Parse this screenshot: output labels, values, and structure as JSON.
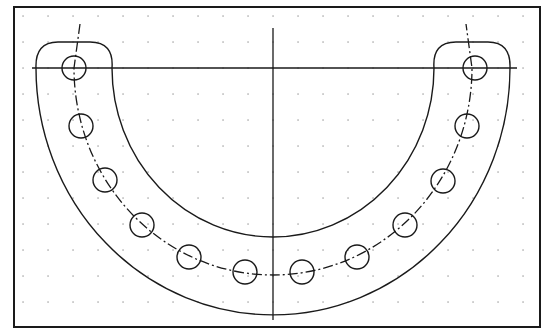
{
  "drawing": {
    "type": "cad-part-outline",
    "description": "Horseshoe (U-shaped) flange with bolt-hole pattern on a dotted grid",
    "colors": {
      "background": "#ffffff",
      "line": "#1a1a1a",
      "grid": "#9a9a9a"
    },
    "frame": {
      "x": 14,
      "y": 7,
      "width": 526,
      "height": 320
    },
    "grid": {
      "x0": 23,
      "y0": 16,
      "spacing_x": 25,
      "spacing_y": 26
    },
    "center": {
      "x": 273,
      "y": 68
    },
    "outer_radius": {
      "rx": 237,
      "ry": 247
    },
    "inner_radius": {
      "rx": 161,
      "ry": 169
    },
    "bolt_circle_radius": {
      "rx": 199,
      "ry": 207
    },
    "hole_radius": 12,
    "bolt_holes": [
      {
        "x": 74,
        "y": 68
      },
      {
        "x": 81,
        "y": 126
      },
      {
        "x": 105,
        "y": 180
      },
      {
        "x": 142,
        "y": 225
      },
      {
        "x": 189,
        "y": 257
      },
      {
        "x": 245,
        "y": 272
      },
      {
        "x": 302,
        "y": 272
      },
      {
        "x": 357,
        "y": 257
      },
      {
        "x": 405,
        "y": 225
      },
      {
        "x": 443,
        "y": 181
      },
      {
        "x": 467,
        "y": 126
      },
      {
        "x": 475,
        "y": 68
      }
    ],
    "ear_top_y": 42
  }
}
